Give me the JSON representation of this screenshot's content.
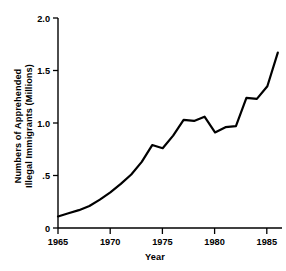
{
  "figure": {
    "name": "apprehended-illegal-immigrants-line-chart",
    "background": "#ffffff",
    "line_color": "#000000",
    "axis_color": "#000000"
  },
  "chart_data": {
    "type": "line",
    "title": "",
    "xlabel": "Year",
    "ylabel": "Numbers of Apprehended Illegal Immigrants (Millions)",
    "ylabel_line1": "Numbers of Apprehended",
    "ylabel_line2": "Illegal Immigrants (Millions)",
    "xlim": [
      1965,
      1986.4
    ],
    "ylim": [
      0,
      2.0
    ],
    "xticks": [
      1965,
      1970,
      1975,
      1980,
      1985
    ],
    "xticklabels": [
      "1965",
      "1970",
      "1975",
      "1980",
      "1985"
    ],
    "yticks": [
      0,
      0.5,
      1.0,
      1.5,
      2.0
    ],
    "yticklabels": [
      "0",
      ".5",
      "1.0",
      "1.5",
      "2.0"
    ],
    "grid": false,
    "legend": false,
    "series": [
      {
        "name": "Apprehended illegal immigrants",
        "x": [
          1965,
          1966,
          1967,
          1968,
          1969,
          1970,
          1971,
          1972,
          1973,
          1974,
          1975,
          1976,
          1977,
          1978,
          1979,
          1980,
          1981,
          1982,
          1983,
          1984,
          1985,
          1986
        ],
        "values": [
          0.11,
          0.14,
          0.17,
          0.21,
          0.27,
          0.34,
          0.42,
          0.51,
          0.63,
          0.79,
          0.76,
          0.88,
          1.03,
          1.02,
          1.06,
          0.91,
          0.96,
          0.97,
          1.24,
          1.23,
          1.35,
          1.67
        ]
      }
    ]
  }
}
